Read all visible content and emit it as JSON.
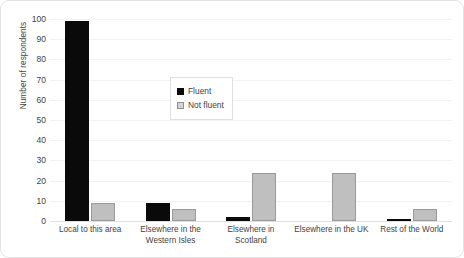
{
  "chart_data": {
    "type": "bar",
    "title": "",
    "xlabel": "",
    "ylabel": "Number of respondents",
    "ylim": [
      0,
      100
    ],
    "ytick_step": 10,
    "yticks": [
      100,
      90,
      80,
      70,
      60,
      50,
      40,
      30,
      20,
      10,
      0
    ],
    "grid": true,
    "legend_position": "inside-upper-center",
    "categories": [
      "Local to this area",
      "Elsewhere in the Western Isles",
      "Elsewhere in Scotland",
      "Elsewhere in the UK",
      "Rest of the World"
    ],
    "series": [
      {
        "name": "Fluent",
        "color": "#0a0a0a",
        "values": [
          99,
          9,
          2,
          0,
          1
        ]
      },
      {
        "name": "Not fluent",
        "color": "#bfbfbf",
        "values": [
          9,
          6,
          24,
          24,
          6
        ]
      }
    ]
  },
  "legend": {
    "items": [
      {
        "label": "Fluent"
      },
      {
        "label": "Not fluent"
      }
    ]
  },
  "x_axis": {
    "labels": [
      "Local to this area",
      "Elsewhere in the\nWestern Isles",
      "Elsewhere in Scotland",
      "Elsewhere in the UK",
      "Rest of the World"
    ]
  }
}
